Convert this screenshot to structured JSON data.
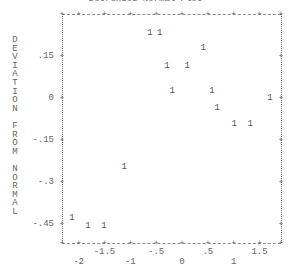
{
  "chart_data": {
    "type": "scatter",
    "title": "Detrended Normal Plot",
    "xlabel": "",
    "ylabel": "DEVIATION FROM NORMAL",
    "xlim": [
      -2.2,
      1.95
    ],
    "ylim": [
      -0.5,
      0.3
    ],
    "grid": false,
    "legend": null,
    "marker": "1",
    "x_ticks": [
      -2,
      -1.5,
      -1,
      -0.5,
      0,
      0.5,
      1,
      1.5
    ],
    "x_tick_labels": [
      "-2",
      "-1.5",
      "-1",
      "-.5",
      "0",
      ".5",
      "1",
      "1.5"
    ],
    "y_ticks": [
      0.15,
      0,
      -0.15,
      -0.3,
      -0.45
    ],
    "y_tick_labels": [
      ".15",
      "0",
      "-.15",
      "-.3",
      "-.45"
    ],
    "points": [
      {
        "x": -0.62,
        "y": 0.232
      },
      {
        "x": -0.43,
        "y": 0.232
      },
      {
        "x": 0.41,
        "y": 0.179
      },
      {
        "x": -0.29,
        "y": 0.114
      },
      {
        "x": 0.1,
        "y": 0.114
      },
      {
        "x": -0.19,
        "y": 0.025
      },
      {
        "x": 0.58,
        "y": 0.025
      },
      {
        "x": 1.7,
        "y": 0.0
      },
      {
        "x": 0.68,
        "y": -0.036
      },
      {
        "x": 1.01,
        "y": -0.093
      },
      {
        "x": 1.32,
        "y": -0.093
      },
      {
        "x": -1.12,
        "y": -0.246
      },
      {
        "x": -2.13,
        "y": -0.429
      },
      {
        "x": -1.82,
        "y": -0.457
      },
      {
        "x": -1.51,
        "y": -0.457
      }
    ]
  },
  "ylabel_letters": [
    "D",
    "E",
    "V",
    "I",
    "A",
    "T",
    "I",
    "O",
    "N",
    "",
    "F",
    "R",
    "O",
    "M",
    "",
    "N",
    "O",
    "R",
    "M",
    "A",
    "L"
  ]
}
